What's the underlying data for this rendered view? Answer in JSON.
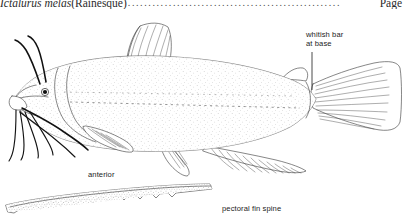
{
  "page": {
    "background_color": "#ffffff",
    "ink_color": "#3c3c3c",
    "label_color": "#1c1c1c"
  },
  "header": {
    "species_italic": "Ictalurus melas",
    "authority": " (Rainesque)",
    "leader_dots": "....................................................",
    "page_word": "Page"
  },
  "figure": {
    "caption_labels": {
      "whitish_bar_line1": "whitish bar",
      "whitish_bar_line2": "at base",
      "anterior": "anterior",
      "pectoral_fin_spine": "pectoral fin spine"
    },
    "detail_subject": "pectoral fin spine, enlarged",
    "parts": [
      "dorsal-fin",
      "adipose-fin",
      "caudal-fin",
      "anal-fin",
      "pelvic-fin",
      "pectoral-fin",
      "nasal-barbels",
      "maxillary-barbels",
      "chin-barbels",
      "eye",
      "lateral-line"
    ]
  }
}
